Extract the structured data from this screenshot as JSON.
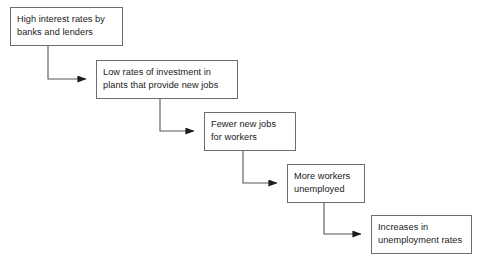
{
  "diagram": {
    "type": "flowchart-cascade",
    "background_color": "#ffffff",
    "box_border_color": "#6e6e6e",
    "connector_color": "#555555",
    "text_color": "#1a1a1a",
    "nodes": [
      {
        "id": "node-1",
        "label": "High interest rates by\nbanks and lenders",
        "x": 10,
        "y": 7,
        "width": 113,
        "height": 39
      },
      {
        "id": "node-2",
        "label": "Low rates of investment in\nplants that provide new jobs",
        "x": 96,
        "y": 60,
        "width": 142,
        "height": 39
      },
      {
        "id": "node-3",
        "label": "Fewer new jobs\nfor workers",
        "x": 204,
        "y": 112,
        "width": 92,
        "height": 39
      },
      {
        "id": "node-4",
        "label": "More workers\nunemployed",
        "x": 287,
        "y": 164,
        "width": 78,
        "height": 39
      },
      {
        "id": "node-5",
        "label": "Increases in\nunemployment rates",
        "x": 371,
        "y": 215,
        "width": 101,
        "height": 39
      }
    ],
    "connectors": [
      {
        "id": "connector-1-2",
        "from": "node-1",
        "to": "node-2",
        "path": "M 48 46 L 48 79 L 88 79",
        "arrow_at": [
          88,
          79
        ]
      },
      {
        "id": "connector-2-3",
        "from": "node-2",
        "to": "node-3",
        "path": "M 160 99 L 160 131 L 196 131",
        "arrow_at": [
          196,
          131
        ]
      },
      {
        "id": "connector-3-4",
        "from": "node-3",
        "to": "node-4",
        "path": "M 243 151 L 243 183 L 279 183",
        "arrow_at": [
          279,
          183
        ]
      },
      {
        "id": "connector-4-5",
        "from": "node-4",
        "to": "node-5",
        "path": "M 324 203 L 324 234 L 363 234",
        "arrow_at": [
          363,
          234
        ]
      }
    ]
  }
}
